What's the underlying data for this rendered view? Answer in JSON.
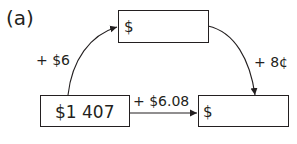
{
  "part_label": "(a)",
  "boxes": {
    "top": {
      "text": "$"
    },
    "left": {
      "text": "$1 407"
    },
    "right": {
      "text": "$"
    }
  },
  "arrows": {
    "left_to_top": {
      "label": "+ $6"
    },
    "top_to_right": {
      "label": "+ 8¢"
    },
    "left_to_right": {
      "label": "+ $6.08"
    }
  },
  "colors": {
    "ink": "#231f20",
    "background": "#ffffff"
  }
}
